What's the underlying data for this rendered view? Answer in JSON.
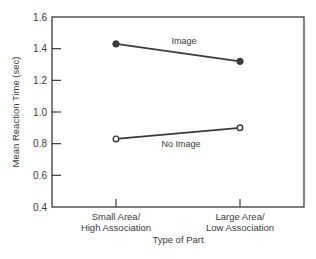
{
  "chart_data": {
    "type": "line",
    "title": "",
    "xlabel": "Type of Part",
    "ylabel": "Mean Reaction Time (sec)",
    "ylim": [
      0.4,
      1.6
    ],
    "yticks": [
      0.4,
      0.6,
      0.8,
      1.0,
      1.2,
      1.4,
      1.6
    ],
    "ytick_labels": [
      "0.4",
      "0.6",
      "0.8",
      "1.0",
      "1.2",
      "1.4",
      "1.6"
    ],
    "categories": [
      [
        "Small Area/",
        "High Association"
      ],
      [
        "Large Area/",
        "Low Association"
      ]
    ],
    "grid": false,
    "legend": "inline labels on lines",
    "series": [
      {
        "name": "Image",
        "values": [
          1.43,
          1.32
        ],
        "marker": "filled-circle",
        "color": "#3a3a3a"
      },
      {
        "name": "No Image",
        "values": [
          0.83,
          0.9
        ],
        "marker": "open-circle",
        "color": "#3a3a3a"
      }
    ]
  },
  "colors": {
    "ink": "#3a3a3a",
    "background": "#ffffff"
  }
}
